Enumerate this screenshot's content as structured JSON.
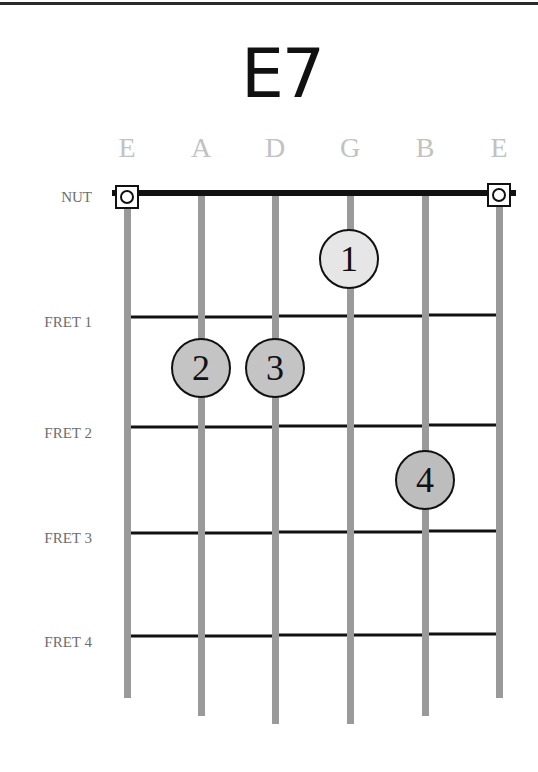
{
  "chord": {
    "name": "E7"
  },
  "strings": [
    {
      "label": "E",
      "x": 127,
      "open": true
    },
    {
      "label": "A",
      "x": 201,
      "open": false
    },
    {
      "label": "D",
      "x": 275,
      "open": false
    },
    {
      "label": "G",
      "x": 350,
      "open": false
    },
    {
      "label": "B",
      "x": 425,
      "open": false
    },
    {
      "label": "E",
      "x": 499,
      "open": true
    }
  ],
  "nut": {
    "label": "NUT",
    "y": 193
  },
  "frets": [
    {
      "label": "FRET 1",
      "y": 316
    },
    {
      "label": "FRET 2",
      "y": 426
    },
    {
      "label": "FRET 3",
      "y": 532
    },
    {
      "label": "FRET 4",
      "y": 635
    }
  ],
  "fingers": [
    {
      "number": "1",
      "string": "G",
      "fret": 1,
      "x": 349,
      "y": 259,
      "fill": "#e6e6e6"
    },
    {
      "number": "2",
      "string": "A",
      "fret": 2,
      "x": 201,
      "y": 368,
      "fill": "#c4c4c4"
    },
    {
      "number": "3",
      "string": "D",
      "fret": 2,
      "x": 275,
      "y": 368,
      "fill": "#c4c4c4"
    },
    {
      "number": "4",
      "string": "B",
      "fret": 3,
      "x": 425,
      "y": 480,
      "fill": "#bdbdbd"
    }
  ],
  "colors": {
    "string": "#9a9a9a",
    "fret": "#111111",
    "nut": "#111111",
    "label": "#c2c2c2",
    "fret_label": "#6e6e6e"
  }
}
